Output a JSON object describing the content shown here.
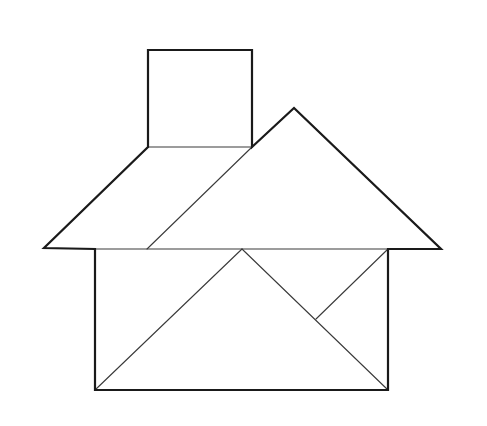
{
  "diagram": {
    "title": "Tangram house",
    "colors": {
      "background": "#ffffff",
      "stroke": "#1a1a1a",
      "inner_stroke": "#3a3a3a"
    },
    "pieces": [
      {
        "name": "chimney-square",
        "points": "148,50 252,50 252,147 148,147"
      },
      {
        "name": "roof-parallelogram",
        "points": "148,147 252,147 147,249 44,248"
      },
      {
        "name": "roof-large-triangle",
        "points": "294,108 441,249 147,249"
      },
      {
        "name": "wall-left-large-triangle",
        "points": "95,390 242,249 388,390"
      },
      {
        "name": "wall-left-corner-triangle",
        "points": "95,249 242,249 95,390"
      },
      {
        "name": "wall-small-triangle",
        "points": "242,249 388,249 316,319"
      },
      {
        "name": "wall-right-small-triangle",
        "points": "388,249 388,390 316,319"
      }
    ],
    "outline": "148,50 252,50 252,147 294,108 441,249 388,249 388,390 95,390 95,249 44,248 148,147",
    "inner_lines": [
      {
        "name": "chimney-base",
        "x1": 148,
        "y1": 147,
        "x2": 252,
        "y2": 147
      },
      {
        "name": "parallelogram-diagonal",
        "x1": 252,
        "y1": 147,
        "x2": 147,
        "y2": 249
      },
      {
        "name": "eave-line",
        "x1": 95,
        "y1": 249,
        "x2": 388,
        "y2": 249
      },
      {
        "name": "wall-diagonal-left",
        "x1": 95,
        "y1": 390,
        "x2": 242,
        "y2": 249
      },
      {
        "name": "wall-diagonal-right",
        "x1": 242,
        "y1": 249,
        "x2": 388,
        "y2": 390
      },
      {
        "name": "small-triangle-edge",
        "x1": 388,
        "y1": 249,
        "x2": 316,
        "y2": 319
      }
    ]
  }
}
